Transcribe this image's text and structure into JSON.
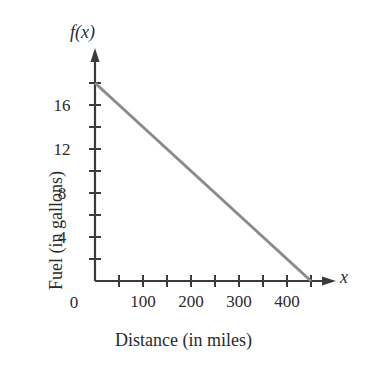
{
  "chart_data": {
    "type": "line",
    "title": "",
    "subtitle": "",
    "xlabel": "Distance (in miles)",
    "ylabel": "Fuel (in gallons)",
    "x_axis_name": "x",
    "y_axis_name": "f(x)",
    "origin_label": "0",
    "xlim": [
      0,
      480
    ],
    "ylim": [
      0,
      19.5
    ],
    "x_tick_step": 50,
    "y_tick_step": 2,
    "x_ticks": [
      50,
      100,
      150,
      200,
      250,
      300,
      350,
      400,
      450
    ],
    "y_ticks": [
      2,
      4,
      6,
      8,
      10,
      12,
      14,
      16,
      18
    ],
    "x_tick_labels": [
      {
        "value": 100,
        "label": "100"
      },
      {
        "value": 200,
        "label": "200"
      },
      {
        "value": 300,
        "label": "300"
      },
      {
        "value": 400,
        "label": "400"
      }
    ],
    "y_tick_labels": [
      {
        "value": 4,
        "label": "4"
      },
      {
        "value": 8,
        "label": "8"
      },
      {
        "value": 12,
        "label": "12"
      },
      {
        "value": 16,
        "label": "16"
      }
    ],
    "grid": false,
    "legend": false,
    "legend_position": "none",
    "series": [
      {
        "name": "fuel-remaining",
        "color": "#8a8a8a",
        "width": 3,
        "points": [
          {
            "x": 0,
            "y": 18
          },
          {
            "x": 450,
            "y": 0
          }
        ],
        "y_intercept": 18,
        "x_intercept": 450,
        "slope": -0.04
      }
    ],
    "annotations": [],
    "axis_color": "#3a3a3a"
  }
}
